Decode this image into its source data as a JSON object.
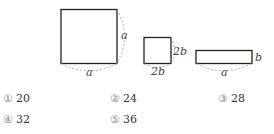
{
  "figures": [
    {
      "name": "large-square",
      "width_label": "a",
      "height_label": "a"
    },
    {
      "name": "small-square",
      "width_label": "2b",
      "height_label": "2b"
    },
    {
      "name": "rectangle",
      "width_label": "a",
      "height_label": "b"
    }
  ],
  "options": [
    {
      "marker": "①",
      "value": "20"
    },
    {
      "marker": "②",
      "value": "24"
    },
    {
      "marker": "③",
      "value": "28"
    },
    {
      "marker": "④",
      "value": "32"
    },
    {
      "marker": "⑤",
      "value": "36"
    }
  ]
}
